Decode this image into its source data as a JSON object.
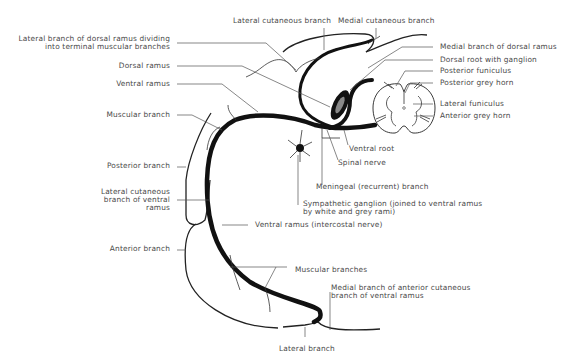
{
  "diagram": {
    "labels": {
      "lateral_cutaneous_branch": "Lateral cutaneous branch",
      "medial_cutaneous_branch": "Medial cutaneous branch",
      "lateral_branch_dorsal_ramus_1": "Lateral branch of dorsal ramus dividing",
      "lateral_branch_dorsal_ramus_2": "into terminal muscular branches",
      "dorsal_ramus": "Dorsal ramus",
      "ventral_ramus": "Ventral ramus",
      "muscular_branch": "Muscular branch",
      "posterior_branch": "Posterior branch",
      "lateral_cutaneous_ventral_1": "Lateral cutaneous",
      "lateral_cutaneous_ventral_2": "branch of ventral",
      "lateral_cutaneous_ventral_3": "ramus",
      "anterior_branch": "Anterior branch",
      "medial_branch_dorsal_ramus": "Medial branch of dorsal ramus",
      "dorsal_root_ganglion": "Dorsal root with ganglion",
      "posterior_funiculus": "Posterior funiculus",
      "posterior_grey_horn": "Posterior grey horn",
      "lateral_funiculus": "Lateral funiculus",
      "anterior_grey_horn": "Anterior grey horn",
      "ventral_root": "Ventral root",
      "spinal_nerve": "Spinal nerve",
      "meningeal_branch": "Meningeal (recurrent) branch",
      "sympathetic_ganglion_1": "Sympathetic ganglion (joined to ventral ramus",
      "sympathetic_ganglion_2": "by white and grey rami)",
      "ventral_ramus_intercostal": "Ventral ramus (intercostal nerve)",
      "muscular_branches": "Muscular branches",
      "medial_branch_anterior_cutaneous_1": "Medial branch of anterior cutaneous",
      "medial_branch_anterior_cutaneous_2": "branch of ventral ramus",
      "lateral_branch": "Lateral branch"
    },
    "colors": {
      "line": "#111111",
      "label": "#4a4a4a",
      "background": "#ffffff"
    }
  }
}
